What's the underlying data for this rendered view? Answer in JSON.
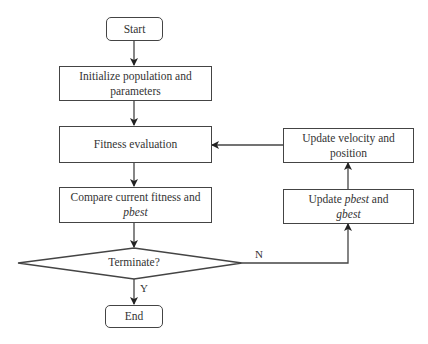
{
  "diagram": {
    "type": "flowchart",
    "nodes": {
      "start": {
        "label": "Start",
        "shape": "rounded-rect"
      },
      "init": {
        "line1": "Initialize population and",
        "line2": "parameters",
        "shape": "rect"
      },
      "fitness": {
        "label": "Fitness evaluation",
        "shape": "rect"
      },
      "compare": {
        "line1": "Compare current fitness and",
        "line2_italic": "pbest",
        "shape": "rect"
      },
      "terminate": {
        "label": "Terminate?",
        "shape": "diamond"
      },
      "end": {
        "label": "End",
        "shape": "rounded-rect"
      },
      "update_velocity": {
        "line1": "Update velocity and",
        "line2": "position",
        "shape": "rect"
      },
      "update_best": {
        "prefix": "Update ",
        "italic1": "pbest",
        "middle": " and",
        "italic2": "gbest",
        "shape": "rect"
      }
    },
    "edges": [
      {
        "from": "start",
        "to": "init"
      },
      {
        "from": "init",
        "to": "fitness"
      },
      {
        "from": "fitness",
        "to": "compare"
      },
      {
        "from": "compare",
        "to": "terminate"
      },
      {
        "from": "terminate",
        "to": "end",
        "label": "Y"
      },
      {
        "from": "terminate",
        "to": "update_best",
        "label": "N"
      },
      {
        "from": "update_best",
        "to": "update_velocity"
      },
      {
        "from": "update_velocity",
        "to": "fitness"
      }
    ],
    "edge_labels": {
      "yes": "Y",
      "no": "N"
    }
  }
}
